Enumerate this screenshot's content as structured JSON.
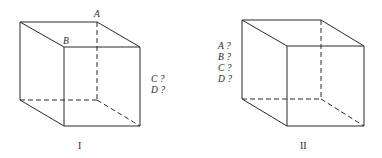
{
  "figure": {
    "line_color": "#2a2a2a",
    "cubes": [
      {
        "id": "I",
        "caption": "I",
        "vertex_labels": {
          "A": "A",
          "B": "B"
        },
        "questions": [
          "C ?",
          "D ?"
        ]
      },
      {
        "id": "II",
        "caption": "II",
        "questions": [
          "A ?",
          "B ?",
          "C ?",
          "D ?"
        ]
      }
    ]
  }
}
